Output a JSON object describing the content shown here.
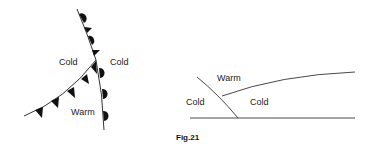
{
  "left_figure": {
    "labels": {
      "cold_left": "Cold",
      "cold_right": "Cold",
      "warm": "Warm"
    },
    "fronts": [
      {
        "type": "occluded",
        "description": "upper segment with alternating triangles and semicircles"
      },
      {
        "type": "cold",
        "description": "lower-left segment with triangles"
      },
      {
        "type": "warm",
        "description": "lower-right segment with semicircles"
      }
    ]
  },
  "right_figure": {
    "labels": {
      "warm": "Warm",
      "cold_left": "Cold",
      "cold_right": "Cold"
    },
    "caption": "Fig.21"
  },
  "colors": {
    "line": "#333333",
    "symbol": "#111111",
    "text": "#222222"
  }
}
